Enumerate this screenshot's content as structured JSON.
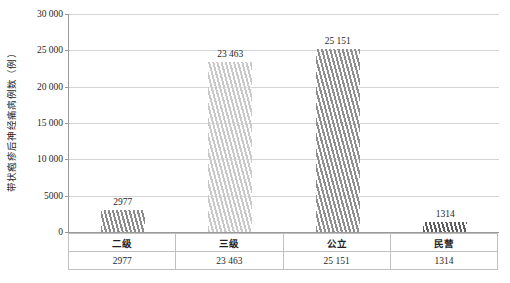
{
  "chart_data": {
    "type": "bar",
    "title": "",
    "xlabel": "",
    "ylabel": "带状疱疹后神经痛病例数（例）",
    "categories": [
      "二级",
      "三级",
      "公立",
      "民营"
    ],
    "values": [
      2977,
      23463,
      25151,
      1314
    ],
    "value_labels": [
      "2977",
      "23 463",
      "25 151",
      "1314"
    ],
    "ylim": [
      0,
      30000
    ],
    "ytick_values": [
      0,
      5000,
      10000,
      15000,
      20000,
      25000,
      30000
    ],
    "ytick_labels": [
      "0",
      "5000",
      "10 000",
      "15 000",
      "20 000",
      "25 000",
      "30 000"
    ],
    "grid": true,
    "legend": "none",
    "bar_colors": [
      "#8c8c8c",
      "#c9c9c9",
      "#8f8f8f",
      "#5e5e5e"
    ],
    "data_table": {
      "header_row": [
        "二级",
        "三级",
        "公立",
        "民营"
      ],
      "value_row": [
        "2977",
        "23 463",
        "25 151",
        "1314"
      ]
    }
  }
}
